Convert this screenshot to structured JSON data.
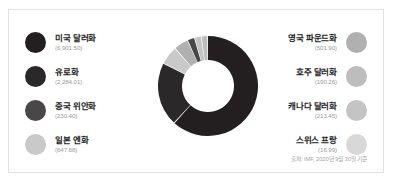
{
  "chart_data": {
    "type": "pie",
    "title": "",
    "subtitle": "",
    "xlabel": "",
    "ylabel": "",
    "donut": true,
    "legend_position": "both-sides",
    "grid": false,
    "unit": "billion USD",
    "categories": [
      "미국 달러화",
      "유로화",
      "중국 위안화",
      "일본 엔화",
      "영국 파운드화",
      "호주 달러화",
      "캐나다 달러화",
      "스위스 프랑"
    ],
    "values": [
      6901.5,
      2284.01,
      230.4,
      647.68,
      501.9,
      190.26,
      213.45,
      16.99
    ],
    "value_labels": [
      "(6,901.50)",
      "(2,284.01)",
      "(230.40)",
      "(647.68)",
      "(501.90)",
      "(190.26)",
      "(213.45)",
      "(16.99)"
    ],
    "colors": [
      "#231f20",
      "#2b2829",
      "#4a4748",
      "#c9c9c9",
      "#b0b0b0",
      "#bdbdbd",
      "#c4c4c4",
      "#d8d8d8"
    ],
    "slices": [
      {
        "label": "미국 달러화",
        "value": 6901.5,
        "value_label": "(6,901.50)",
        "color": "#231f20",
        "start_angle": 0,
        "end_angle": 222.0
      },
      {
        "label": "유로화",
        "value": 2284.01,
        "value_label": "(2,284.01)",
        "color": "#2b2829",
        "start_angle": 223.0,
        "end_angle": 296.5
      },
      {
        "label": "일본 엔화",
        "value": 647.68,
        "value_label": "(647.68)",
        "color": "#c9c9c9",
        "start_angle": 297.5,
        "end_angle": 318.3
      },
      {
        "label": "영국 파운드화",
        "value": 501.9,
        "value_label": "(501.90)",
        "color": "#b0b0b0",
        "start_angle": 319.3,
        "end_angle": 335.4
      },
      {
        "label": "중국 위안화",
        "value": 230.4,
        "value_label": "(230.40)",
        "color": "#4a4748",
        "start_angle": 336.4,
        "end_angle": 343.8
      },
      {
        "label": "캐나다 달러화",
        "value": 213.45,
        "value_label": "(213.45)",
        "color": "#c4c4c4",
        "start_angle": 344.8,
        "end_angle": 351.7
      },
      {
        "label": "호주 달러화",
        "value": 190.26,
        "value_label": "(190.26)",
        "color": "#bdbdbd",
        "start_angle": 352.7,
        "end_angle": 358.8
      },
      {
        "label": "스위스 프랑",
        "value": 16.99,
        "value_label": "(16.99)",
        "color": "#d8d8d8",
        "start_angle": 359.0,
        "end_angle": 359.5
      }
    ]
  },
  "legend_left": [
    {
      "label": "미국 달러화",
      "value": "(6,901.50)",
      "color": "#231f20"
    },
    {
      "label": "유로화",
      "value": "(2,284.01)",
      "color": "#2b2829"
    },
    {
      "label": "중국 위안화",
      "value": "(230.40)",
      "color": "#4a4748"
    },
    {
      "label": "일본 엔화",
      "value": "(647.68)",
      "color": "#c9c9c9"
    }
  ],
  "legend_right": [
    {
      "label": "영국 파운드화",
      "value": "(501.90)",
      "color": "#b0b0b0"
    },
    {
      "label": "호주 달러화",
      "value": "(190.26)",
      "color": "#bdbdbd"
    },
    {
      "label": "캐나다 달러화",
      "value": "(213.45)",
      "color": "#c4c4c4"
    },
    {
      "label": "스위스 프랑",
      "value": "(16.99)",
      "color": "#d8d8d8"
    }
  ],
  "source": "출처: IMF, 2020년 9월 30일 기준"
}
